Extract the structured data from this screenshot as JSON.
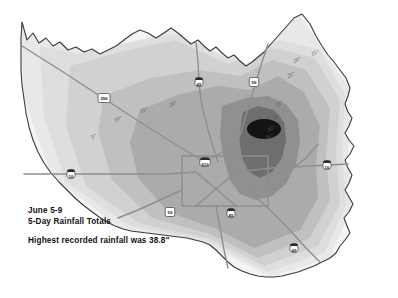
{
  "map": {
    "title_lines": [
      "June 5-9",
      "5-Day Rainfall Totals"
    ],
    "note": "Highest recorded rainfall was 38.8\"",
    "region_name": "Harris County",
    "units_label": "inches",
    "background_color": "#ffffff",
    "boundary_color": "#3a3a3a",
    "road_color": "#8e8e8e",
    "max_core_color": "#141414"
  },
  "chart_data": {
    "type": "heatmap",
    "title": "June 5-9 5-Day Rainfall Totals",
    "subtitle": "Highest recorded rainfall was 38.8\"",
    "xlabel": "",
    "ylabel": "",
    "variable": "5-day rainfall total",
    "units": "inches",
    "max_value": 38.8,
    "min_value": 5,
    "legend_position": "none",
    "grid": false,
    "contour_levels": [
      5,
      10,
      15,
      20,
      25,
      30,
      35
    ],
    "band_fills": [
      {
        "level": "<5",
        "color": "#f2f2f2"
      },
      {
        "level": "5-10",
        "color": "#e6e6e6"
      },
      {
        "level": "10-15",
        "color": "#dcdcdc"
      },
      {
        "level": "15-20",
        "color": "#cfcfcf"
      },
      {
        "level": "20-25",
        "color": "#bdbdbd"
      },
      {
        "level": "25-30",
        "color": "#a5a5a5"
      },
      {
        "level": "30-35",
        "color": "#8a8a8a"
      },
      {
        "level": ">35",
        "color": "#141414"
      }
    ],
    "contour_labels": [
      {
        "text": "5\"",
        "value": 5,
        "x": 92,
        "y": 139
      },
      {
        "text": "10\"",
        "value": 10,
        "x": 115,
        "y": 122
      },
      {
        "text": "15\"",
        "value": 15,
        "x": 141,
        "y": 113
      },
      {
        "text": "20\"",
        "value": 20,
        "x": 170,
        "y": 107
      },
      {
        "text": "15\"",
        "value": 15,
        "x": 276,
        "y": 107
      },
      {
        "text": "20\"",
        "value": 20,
        "x": 273,
        "y": 120
      },
      {
        "text": "25\"",
        "value": 25,
        "x": 288,
        "y": 78
      },
      {
        "text": "20\"",
        "value": 20,
        "x": 294,
        "y": 63
      },
      {
        "text": "15\"",
        "value": 15,
        "x": 312,
        "y": 56
      },
      {
        "text": "30\"",
        "value": 30,
        "x": 268,
        "y": 132
      },
      {
        "text": "35\"",
        "value": 35,
        "x": 266,
        "y": 140
      }
    ]
  },
  "highways": [
    {
      "id": "us-290",
      "type": "us",
      "number": "290",
      "x": 104,
      "y": 98
    },
    {
      "id": "i-45-north",
      "type": "interstate",
      "number": "45",
      "x": 199,
      "y": 82
    },
    {
      "id": "us-59-north",
      "type": "us",
      "number": "59",
      "x": 254,
      "y": 82
    },
    {
      "id": "i-10-west",
      "type": "interstate",
      "number": "10",
      "x": 71,
      "y": 174
    },
    {
      "id": "i-610-loop",
      "type": "interstate",
      "number": "610",
      "x": 205,
      "y": 162
    },
    {
      "id": "i-10-east",
      "type": "interstate",
      "number": "10",
      "x": 327,
      "y": 165
    },
    {
      "id": "sh-59-south",
      "type": "state",
      "number": "59",
      "x": 170,
      "y": 212
    },
    {
      "id": "i-45-south",
      "type": "interstate",
      "number": "45",
      "x": 231,
      "y": 213
    },
    {
      "id": "i-45-gulf",
      "type": "interstate",
      "number": "45",
      "x": 294,
      "y": 248
    }
  ]
}
